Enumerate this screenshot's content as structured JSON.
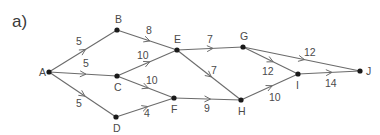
{
  "part_label": "a)",
  "colors": {
    "edge": "#6b6b6b",
    "node": "#1a1a1a",
    "text": "#4a4a4a"
  },
  "nodes": [
    {
      "id": "A",
      "x": 49,
      "y": 72,
      "lx": -10,
      "ly": 4
    },
    {
      "id": "B",
      "x": 117,
      "y": 30,
      "lx": -2,
      "ly": -7
    },
    {
      "id": "C",
      "x": 117,
      "y": 76,
      "lx": -3,
      "ly": 15
    },
    {
      "id": "D",
      "x": 116,
      "y": 117,
      "lx": -3,
      "ly": 15
    },
    {
      "id": "E",
      "x": 177,
      "y": 50,
      "lx": -3,
      "ly": -7
    },
    {
      "id": "F",
      "x": 174,
      "y": 98,
      "lx": -3,
      "ly": 15
    },
    {
      "id": "G",
      "x": 243,
      "y": 47,
      "lx": -3,
      "ly": -7
    },
    {
      "id": "H",
      "x": 241,
      "y": 100,
      "lx": -3,
      "ly": 15
    },
    {
      "id": "I",
      "x": 298,
      "y": 74,
      "lx": -2,
      "ly": 15
    },
    {
      "id": "J",
      "x": 360,
      "y": 71,
      "lx": 6,
      "ly": 4
    }
  ],
  "edges": [
    {
      "from": "A",
      "to": "B",
      "weight": "5",
      "wx": 76,
      "wy": 45
    },
    {
      "from": "A",
      "to": "C",
      "weight": "5",
      "wx": 83,
      "wy": 67
    },
    {
      "from": "A",
      "to": "D",
      "weight": "5",
      "wx": 76,
      "wy": 107
    },
    {
      "from": "B",
      "to": "E",
      "weight": "8",
      "wx": 146,
      "wy": 34
    },
    {
      "from": "C",
      "to": "E",
      "weight": "10",
      "wx": 137,
      "wy": 59
    },
    {
      "from": "C",
      "to": "F",
      "weight": "10",
      "wx": 146,
      "wy": 84
    },
    {
      "from": "D",
      "to": "F",
      "weight": "4",
      "wx": 144,
      "wy": 117
    },
    {
      "from": "E",
      "to": "G",
      "weight": "7",
      "wx": 207,
      "wy": 43
    },
    {
      "from": "E",
      "to": "H",
      "weight": "7",
      "wx": 211,
      "wy": 74
    },
    {
      "from": "F",
      "to": "H",
      "weight": "9",
      "wx": 204,
      "wy": 112
    },
    {
      "from": "G",
      "to": "I",
      "weight": "12",
      "wx": 262,
      "wy": 75
    },
    {
      "from": "G",
      "to": "J",
      "weight": "12",
      "wx": 304,
      "wy": 56
    },
    {
      "from": "H",
      "to": "I",
      "weight": "10",
      "wx": 269,
      "wy": 101
    },
    {
      "from": "I",
      "to": "J",
      "weight": "14",
      "wx": 325,
      "wy": 87
    }
  ]
}
